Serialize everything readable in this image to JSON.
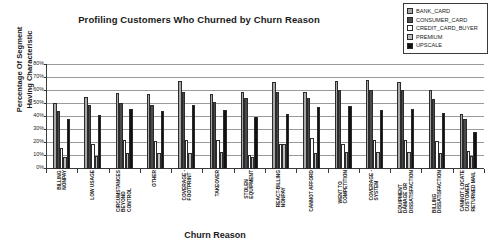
{
  "chart_data": {
    "type": "bar",
    "title": "Profiling Customers Who Churned by Churn Reason",
    "xlabel": "Churn Reason",
    "ylabel": "Percentage Of Segment Having Characteristic",
    "ylim": [
      0,
      80
    ],
    "ytick_labels": [
      "80%",
      "70%",
      "60%",
      "50%",
      "40%",
      "30%",
      "20%",
      "10%",
      "0%"
    ],
    "ytick_values": [
      80,
      70,
      60,
      50,
      40,
      30,
      20,
      10,
      0
    ],
    "grid": true,
    "legend_position": "top-right",
    "categories": [
      "BILLING NONPAY",
      "LOW USAGE",
      "CIRCUMSTANCES BEYOND CONTROL",
      "OTHER",
      "COVERAGE - FOOTPRINT",
      "TAKEOVER",
      "STOLEN EQUIPMENT",
      "REACT-BILLING NONPAY",
      "CANNOT AFFORD",
      "WENT TO COMPETITION",
      "COVERAGE - SYSTEM",
      "EQUIPMENT DAMAGE OR DISSATISFACTION",
      "BILLING DISSATISFACTION",
      "CANNOT LOCATE CUSTOMER, RETURNED MAIL"
    ],
    "series": [
      {
        "name": "BANK_CARD",
        "color": "#a8a8a8",
        "values": [
          50,
          55,
          58,
          57,
          67,
          57,
          59,
          66,
          59,
          67,
          68,
          66,
          60,
          42
        ]
      },
      {
        "name": "CONSUMER_CARD",
        "color": "#4a4a4a",
        "values": [
          44,
          49,
          50,
          49,
          59,
          51,
          54,
          59,
          54,
          60,
          60,
          60,
          53,
          38
        ]
      },
      {
        "name": "CREDIT_CARD_BUYER",
        "color": "#ffffff",
        "values": [
          16,
          19,
          22,
          21,
          22,
          22,
          11,
          19,
          24,
          19,
          22,
          22,
          21,
          14
        ]
      },
      {
        "name": "PREMIUM",
        "color": "#bdbdbd",
        "values": [
          9,
          10,
          12,
          12,
          12,
          13,
          9,
          19,
          12,
          13,
          13,
          13,
          12,
          10
        ]
      },
      {
        "name": "UPSCALE",
        "color": "#111111",
        "values": [
          38,
          41,
          46,
          44,
          49,
          45,
          40,
          42,
          47,
          48,
          45,
          46,
          43,
          28
        ]
      }
    ]
  },
  "legend": {
    "items": [
      {
        "label": "BANK_CARD",
        "swatch": "#a8a8a8"
      },
      {
        "label": "CONSUMER_CARD",
        "swatch": "#4a4a4a"
      },
      {
        "label": "CREDIT_CARD_BUYER",
        "swatch": "#ffffff"
      },
      {
        "label": "PREMIUM",
        "swatch": "#bdbdbd"
      },
      {
        "label": "UPSCALE",
        "swatch": "#111111"
      }
    ]
  }
}
